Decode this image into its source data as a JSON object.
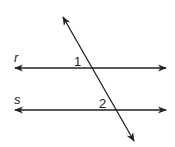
{
  "diagram": {
    "lines": [
      {
        "name": "r",
        "label": "r",
        "type": "parallel-line"
      },
      {
        "name": "s",
        "label": "s",
        "type": "parallel-line"
      },
      {
        "name": "transversal",
        "type": "transversal"
      }
    ],
    "angles": [
      {
        "label": "1",
        "at": "intersection-r"
      },
      {
        "label": "2",
        "at": "intersection-s"
      }
    ],
    "color": "#222222"
  }
}
